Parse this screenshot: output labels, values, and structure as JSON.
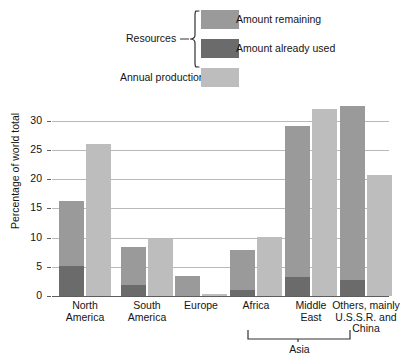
{
  "chart_data": {
    "type": "bar",
    "title": "",
    "xlabel": "",
    "ylabel": "Percentage of world total",
    "ylim": [
      0,
      33
    ],
    "yticks": [
      0,
      5,
      10,
      15,
      20,
      25,
      30
    ],
    "ytick_labels": [
      "0",
      "5",
      "10",
      "15",
      "20",
      "25",
      "30"
    ],
    "grid": true,
    "legend_position": "top",
    "categories": [
      "North America",
      "South America",
      "Europe",
      "Africa",
      "Middle East",
      "Others, mainly U.S.S.R. and China"
    ],
    "category_lines": [
      [
        "North",
        "America"
      ],
      [
        "South",
        "America"
      ],
      [
        "Europe"
      ],
      [
        "Africa"
      ],
      [
        "Middle",
        "East"
      ],
      [
        "Others, mainly",
        "U.S.S.R. and",
        "China"
      ]
    ],
    "series": [
      {
        "name": "Amount remaining",
        "color": "#9a9a9a",
        "values": [
          11.1,
          6.5,
          3.4,
          6.8,
          25.7,
          29.7
        ]
      },
      {
        "name": "Amount already used",
        "color": "#6b6b6b",
        "values": [
          5.2,
          1.9,
          0.0,
          1.0,
          3.3,
          2.8
        ]
      },
      {
        "name": "Annual production",
        "color": "#bdbdbd",
        "values": [
          26.0,
          9.7,
          0.3,
          10.1,
          32.0,
          20.7
        ]
      }
    ],
    "resources_totals": [
      16.3,
      8.4,
      3.4,
      7.8,
      29.0,
      32.5
    ],
    "group_bracket": {
      "label": "Asia",
      "covers": [
        "Middle East",
        "Others, mainly U.S.S.R. and China"
      ]
    }
  },
  "legend": {
    "resources_brace_label": "Resources",
    "items": [
      {
        "label": "Amount remaining",
        "swatch_color": "#9a9a9a"
      },
      {
        "label": "Amount already used",
        "swatch_color": "#6b6b6b"
      }
    ],
    "annual_production": {
      "label": "Annual production",
      "swatch_color": "#bdbdbd"
    }
  },
  "colors": {
    "remaining": "#9a9a9a",
    "used": "#6b6b6b",
    "production": "#bdbdbd",
    "gridline": "#b9b9b9",
    "axis": "#5d5d5d",
    "text": "#141414",
    "background": "#ffffff"
  }
}
